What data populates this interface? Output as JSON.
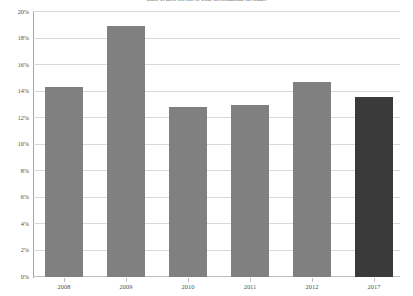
{
  "chart_data": {
    "type": "bar",
    "title": "Ratio of Debt Service to Total Governmental Revenues",
    "xlabel": "",
    "ylabel": "",
    "categories": [
      "2008",
      "2009",
      "2010",
      "2011",
      "2012",
      "2017"
    ],
    "values": [
      14.3,
      18.9,
      12.8,
      12.9,
      14.7,
      13.5
    ],
    "value_labels": [
      "14.3%",
      "18.9%",
      "12.8%",
      "12.9%",
      "14.7%",
      "13.5%"
    ],
    "ylim": [
      0,
      20
    ],
    "ytick_values": [
      20,
      18,
      16,
      14,
      12,
      10,
      8,
      6,
      4,
      2,
      0
    ],
    "ytick_labels": [
      "20%",
      "18%",
      "16%",
      "14%",
      "12%",
      "10%",
      "8%",
      "6%",
      "4%",
      "2%",
      "0%"
    ],
    "grid": true,
    "legend": false,
    "legend_position": "none",
    "series": [
      {
        "name": "Debt Service Ratio",
        "values": [
          14.3,
          18.9,
          12.8,
          12.9,
          14.7,
          13.5
        ]
      }
    ],
    "colors": {
      "bar_default": "#808080",
      "bar_highlight": "#3a3a3a",
      "gridline": "#d9d9d9",
      "axis": "#a6a6a6",
      "text": "#4d4d4f"
    },
    "highlight_index": 5
  }
}
